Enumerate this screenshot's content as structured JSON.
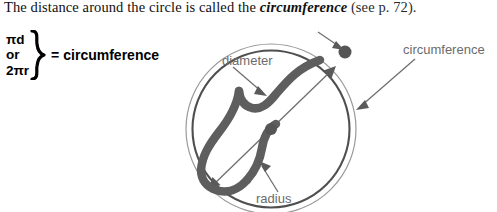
{
  "passage": {
    "lead": "The distance around the circle is called the ",
    "term": "circumference",
    "tail": " (see p. 72)."
  },
  "formula": {
    "line1": "πd",
    "line2": "or",
    "line3": "2πr",
    "brace": "right-curly-brace",
    "equals": "=",
    "result": "circumference"
  },
  "diagram": {
    "labels": {
      "diameter": "diameter",
      "radius": "radius",
      "circumference": "circumference"
    },
    "icons": {
      "center_point": "center-dot",
      "edge_point": "circumference-dot",
      "diameter_arrow": "double-headed-arrow",
      "diameter_band": "diameter-brace-band",
      "radius_band": "radius-brace-band"
    }
  },
  "colors": {
    "text": "#101010",
    "label_gray": "#6b6b6b",
    "band_gray": "#595959",
    "circle_outer": "#8d8d8d",
    "circle_inner": "#555555",
    "background": "#ffffff"
  }
}
